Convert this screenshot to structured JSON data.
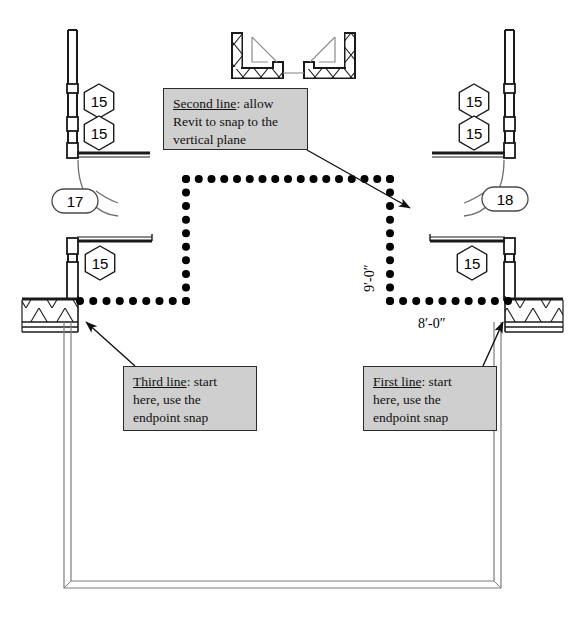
{
  "drawing": {
    "title": "Revit floor plan line-drawing exercise",
    "type": "architectural-floor-plan",
    "background_color": "#ffffff",
    "line_color": "#000000",
    "note_fill_color": "#cfcfcf",
    "note_border_color": "#2b2b2b"
  },
  "notes": [
    {
      "id": "second-line",
      "lead": "Second line",
      "rest": ": allow",
      "line2": "Revit to snap to the",
      "line3": "vertical plane",
      "box": {
        "x": 163,
        "y": 88,
        "w": 145,
        "h": 62
      },
      "arrow": {
        "x1": 307,
        "y1": 150,
        "x2": 410,
        "y2": 208
      }
    },
    {
      "id": "third-line",
      "lead": "Third line",
      "rest": ": start",
      "line2": "here, use the",
      "line3": "endpoint snap",
      "box": {
        "x": 123,
        "y": 366,
        "w": 134,
        "h": 65
      },
      "arrow": {
        "x1": 135,
        "y1": 366,
        "x2": 86,
        "y2": 322
      }
    },
    {
      "id": "first-line",
      "lead": "First line",
      "rest": ": start",
      "line2": "here, use the",
      "line3": "endpoint snap",
      "box": {
        "x": 363,
        "y": 366,
        "w": 134,
        "h": 65
      },
      "arrow": {
        "x1": 483,
        "y1": 366,
        "x2": 503,
        "y2": 322
      }
    }
  ],
  "dimensions": [
    {
      "id": "vertical-dim",
      "label": "9′-0″",
      "orientation": "vertical",
      "x": 362,
      "y": 292
    },
    {
      "id": "horizontal-dim",
      "label": "8′-0″",
      "orientation": "horizontal",
      "x": 418,
      "y": 316
    }
  ],
  "tags": [
    {
      "id": "tag-left-upper-1",
      "shape": "hexagon",
      "label": "15",
      "cx": 99,
      "cy": 101
    },
    {
      "id": "tag-left-upper-2",
      "shape": "hexagon",
      "label": "15",
      "cx": 99,
      "cy": 133
    },
    {
      "id": "tag-left-lower",
      "shape": "hexagon",
      "label": "15",
      "cx": 100,
      "cy": 263
    },
    {
      "id": "tag-right-upper-1",
      "shape": "hexagon",
      "label": "15",
      "cx": 474,
      "cy": 101
    },
    {
      "id": "tag-right-upper-2",
      "shape": "hexagon",
      "label": "15",
      "cx": 474,
      "cy": 133
    },
    {
      "id": "tag-right-lower",
      "shape": "hexagon",
      "label": "15",
      "cx": 472,
      "cy": 263
    },
    {
      "id": "tag-door-left",
      "shape": "oval",
      "label": "17",
      "cx": 75,
      "cy": 201
    },
    {
      "id": "tag-door-right",
      "shape": "oval",
      "label": "18",
      "cx": 505,
      "cy": 199
    }
  ],
  "sketch_path": {
    "id": "dotted-sketch-path",
    "description": "Dotted polyline drawn in three segments forming an inverted U",
    "points": [
      {
        "x": 508,
        "y": 301
      },
      {
        "x": 390,
        "y": 301
      },
      {
        "x": 390,
        "y": 179
      },
      {
        "x": 186,
        "y": 179
      },
      {
        "x": 186,
        "y": 301
      },
      {
        "x": 80,
        "y": 301
      }
    ],
    "dot_radius": 4,
    "dot_spacing": 13
  }
}
